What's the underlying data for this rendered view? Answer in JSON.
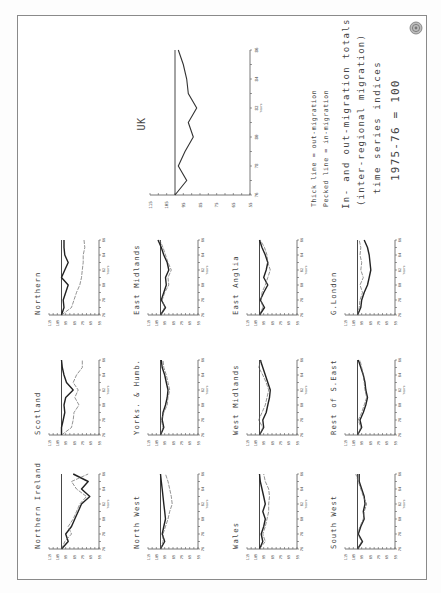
{
  "legend": {
    "line1": "Thick line = out-migration",
    "line2": "Pecked line = in-migration",
    "title1": "In- and out-migration totals",
    "title2": "(inter-regional migration)",
    "title3": "time series indices",
    "title4": "1975-76 = 100"
  },
  "emblem": "crest-emblem",
  "chart_data": [
    {
      "type": "line",
      "title": "UK",
      "xlabel": "Years",
      "x_ticks": [
        "76",
        "78",
        "80",
        "82",
        "84",
        "86"
      ],
      "y_ticks": [
        "115",
        "105",
        "95",
        "85",
        "75",
        "65",
        "55"
      ],
      "ylim": [
        55,
        115
      ],
      "xlim": [
        76,
        86
      ],
      "baseline": 100,
      "x": [
        76,
        77,
        78,
        79,
        80,
        81,
        82,
        83,
        84,
        85,
        86
      ],
      "series": [
        {
          "name": "out-migration",
          "values": [
            100,
            93,
            98,
            94,
            89,
            92,
            87,
            92,
            93,
            95,
            98
          ]
        }
      ]
    },
    {
      "type": "line",
      "title": "Northern",
      "xlabel": "Years",
      "x_ticks": [
        "76",
        "78",
        "80",
        "82",
        "84",
        "86"
      ],
      "y_ticks": [
        "115",
        "105",
        "95",
        "85",
        "75",
        "65",
        "55"
      ],
      "ylim": [
        55,
        115
      ],
      "xlim": [
        76,
        86
      ],
      "baseline": 100,
      "x": [
        76,
        77,
        78,
        79,
        80,
        81,
        82,
        83,
        84,
        85,
        86
      ],
      "series": [
        {
          "name": "out-migration",
          "values": [
            100,
            97,
            98,
            95,
            92,
            100,
            96,
            92,
            96,
            97,
            97
          ]
        },
        {
          "name": "in-migration",
          "values": [
            100,
            88,
            85,
            82,
            78,
            76,
            75,
            74,
            74,
            72,
            73
          ]
        }
      ]
    },
    {
      "type": "line",
      "title": "East Midlands",
      "xlabel": "Years",
      "x_ticks": [
        "76",
        "78",
        "80",
        "82",
        "84",
        "86"
      ],
      "y_ticks": [
        "115",
        "105",
        "95",
        "85",
        "75",
        "65",
        "55"
      ],
      "ylim": [
        55,
        115
      ],
      "xlim": [
        76,
        86
      ],
      "baseline": 100,
      "x": [
        76,
        77,
        78,
        79,
        80,
        81,
        82,
        83,
        84,
        85,
        86
      ],
      "series": [
        {
          "name": "out-migration",
          "values": [
            100,
            94,
            99,
            96,
            93,
            94,
            90,
            92,
            96,
            99,
            103
          ]
        },
        {
          "name": "in-migration",
          "values": [
            100,
            95,
            98,
            95,
            90,
            91,
            87,
            91,
            94,
            97,
            101
          ]
        }
      ]
    },
    {
      "type": "line",
      "title": "East Anglia",
      "xlabel": "Years",
      "x_ticks": [
        "76",
        "78",
        "80",
        "82",
        "84",
        "86"
      ],
      "y_ticks": [
        "115",
        "105",
        "95",
        "85",
        "75",
        "65",
        "55"
      ],
      "ylim": [
        55,
        115
      ],
      "xlim": [
        76,
        86
      ],
      "baseline": 100,
      "x": [
        76,
        77,
        78,
        79,
        80,
        81,
        82,
        83,
        84,
        85,
        86
      ],
      "series": [
        {
          "name": "out-migration",
          "values": [
            100,
            94,
            99,
            95,
            90,
            95,
            92,
            90,
            93,
            97,
            100
          ]
        },
        {
          "name": "in-migration",
          "values": [
            100,
            96,
            98,
            97,
            93,
            90,
            87,
            90,
            91,
            94,
            99
          ]
        }
      ]
    },
    {
      "type": "line",
      "title": "G.London",
      "xlabel": "Years",
      "x_ticks": [
        "76",
        "78",
        "80",
        "82",
        "84",
        "86"
      ],
      "y_ticks": [
        "115",
        "105",
        "95",
        "85",
        "75",
        "65",
        "55"
      ],
      "ylim": [
        55,
        115
      ],
      "xlim": [
        76,
        86
      ],
      "baseline": 100,
      "x": [
        76,
        77,
        78,
        79,
        80,
        81,
        82,
        83,
        84,
        85,
        86
      ],
      "series": [
        {
          "name": "out-migration",
          "values": [
            100,
            96,
            95,
            92,
            88,
            86,
            84,
            85,
            86,
            88,
            92
          ]
        },
        {
          "name": "in-migration",
          "values": [
            100,
            98,
            97,
            94,
            97,
            93,
            96,
            95,
            97,
            96,
            98
          ]
        }
      ]
    },
    {
      "type": "line",
      "title": "Scotland",
      "xlabel": "Years",
      "x_ticks": [
        "76",
        "78",
        "80",
        "82",
        "84",
        "86"
      ],
      "y_ticks": [
        "115",
        "105",
        "95",
        "85",
        "75",
        "65",
        "55"
      ],
      "ylim": [
        55,
        115
      ],
      "xlim": [
        76,
        86
      ],
      "baseline": 100,
      "x": [
        76,
        77,
        78,
        79,
        80,
        81,
        82,
        83,
        84,
        85,
        86
      ],
      "series": [
        {
          "name": "out-migration",
          "values": [
            100,
            100,
            98,
            96,
            97,
            95,
            86,
            94,
            97,
            99,
            100
          ]
        },
        {
          "name": "in-migration",
          "values": [
            100,
            88,
            86,
            85,
            79,
            84,
            80,
            86,
            82,
            75,
            75
          ]
        }
      ]
    },
    {
      "type": "line",
      "title": "Yorks. & Humb.",
      "xlabel": "Years",
      "x_ticks": [
        "76",
        "78",
        "80",
        "82",
        "84",
        "86"
      ],
      "y_ticks": [
        "115",
        "105",
        "95",
        "85",
        "75",
        "65",
        "55"
      ],
      "ylim": [
        55,
        115
      ],
      "xlim": [
        76,
        86
      ],
      "baseline": 100,
      "x": [
        76,
        77,
        78,
        79,
        80,
        81,
        82,
        83,
        84,
        85,
        86
      ],
      "series": [
        {
          "name": "out-migration",
          "values": [
            100,
            96,
            98,
            97,
            94,
            92,
            91,
            93,
            95,
            98,
            99
          ]
        },
        {
          "name": "in-migration",
          "values": [
            100,
            97,
            99,
            96,
            92,
            91,
            89,
            91,
            93,
            96,
            97
          ]
        }
      ]
    },
    {
      "type": "line",
      "title": "West Midlands",
      "xlabel": "Years",
      "x_ticks": [
        "76",
        "78",
        "80",
        "82",
        "84",
        "86"
      ],
      "y_ticks": [
        "115",
        "105",
        "95",
        "85",
        "75",
        "65",
        "55"
      ],
      "ylim": [
        55,
        115
      ],
      "xlim": [
        76,
        86
      ],
      "baseline": 100,
      "x": [
        76,
        77,
        78,
        79,
        80,
        81,
        82,
        83,
        84,
        85,
        86
      ],
      "series": [
        {
          "name": "out-migration",
          "values": [
            100,
            95,
            96,
            92,
            90,
            88,
            87,
            90,
            93,
            96,
            99
          ]
        },
        {
          "name": "in-migration",
          "values": [
            100,
            96,
            101,
            97,
            93,
            91,
            89,
            92,
            96,
            101,
            98
          ]
        }
      ]
    },
    {
      "type": "line",
      "title": "Rest of S.East",
      "xlabel": "Years",
      "x_ticks": [
        "76",
        "78",
        "80",
        "82",
        "84",
        "86"
      ],
      "y_ticks": [
        "115",
        "105",
        "95",
        "85",
        "75",
        "65",
        "55"
      ],
      "ylim": [
        55,
        115
      ],
      "xlim": [
        76,
        86
      ],
      "baseline": 100,
      "x": [
        76,
        77,
        78,
        79,
        80,
        81,
        82,
        83,
        84,
        85,
        86
      ],
      "series": [
        {
          "name": "out-migration",
          "values": [
            100,
            95,
            97,
            93,
            90,
            88,
            90,
            91,
            93,
            96,
            99
          ]
        },
        {
          "name": "in-migration",
          "values": [
            100,
            96,
            99,
            95,
            92,
            89,
            91,
            92,
            93,
            95,
            97
          ]
        }
      ]
    },
    {
      "type": "line",
      "title": "Northern Ireland",
      "xlabel": "Years",
      "x_ticks": [
        "76",
        "78",
        "80",
        "82",
        "84",
        "86"
      ],
      "y_ticks": [
        "115",
        "105",
        "95",
        "85",
        "75",
        "65",
        "55"
      ],
      "ylim": [
        55,
        115
      ],
      "xlim": [
        76,
        86
      ],
      "baseline": 100,
      "x": [
        76,
        77,
        78,
        79,
        80,
        81,
        82,
        83,
        84,
        85,
        86
      ],
      "series": [
        {
          "name": "out-migration",
          "values": [
            100,
            92,
            95,
            88,
            84,
            80,
            76,
            66,
            76,
            68,
            86
          ]
        },
        {
          "name": "in-migration",
          "values": [
            100,
            96,
            88,
            92,
            86,
            82,
            78,
            70,
            82,
            88,
            68
          ]
        }
      ]
    },
    {
      "type": "line",
      "title": "North West",
      "xlabel": "Years",
      "x_ticks": [
        "76",
        "78",
        "80",
        "82",
        "84",
        "86"
      ],
      "y_ticks": [
        "115",
        "105",
        "95",
        "85",
        "75",
        "65",
        "55"
      ],
      "ylim": [
        55,
        115
      ],
      "xlim": [
        76,
        86
      ],
      "baseline": 100,
      "x": [
        76,
        77,
        78,
        79,
        80,
        81,
        82,
        83,
        84,
        85,
        86
      ],
      "series": [
        {
          "name": "out-migration",
          "values": [
            100,
            95,
            98,
            96,
            94,
            95,
            96,
            97,
            98,
            99,
            100
          ]
        },
        {
          "name": "in-migration",
          "values": [
            100,
            97,
            97,
            94,
            91,
            89,
            86,
            87,
            89,
            91,
            94
          ]
        }
      ]
    },
    {
      "type": "line",
      "title": "Wales",
      "xlabel": "Years",
      "x_ticks": [
        "76",
        "78",
        "80",
        "82",
        "84",
        "86"
      ],
      "y_ticks": [
        "115",
        "105",
        "95",
        "85",
        "75",
        "65",
        "55"
      ],
      "ylim": [
        55,
        115
      ],
      "xlim": [
        76,
        86
      ],
      "baseline": 100,
      "x": [
        76,
        77,
        78,
        79,
        80,
        81,
        82,
        83,
        84,
        85,
        86
      ],
      "series": [
        {
          "name": "out-migration",
          "values": [
            100,
            96,
            98,
            95,
            93,
            96,
            93,
            95,
            97,
            99,
            100
          ]
        },
        {
          "name": "in-migration",
          "values": [
            100,
            93,
            96,
            93,
            91,
            89,
            89,
            88,
            89,
            93,
            95
          ]
        }
      ]
    },
    {
      "type": "line",
      "title": "South West",
      "xlabel": "Years",
      "x_ticks": [
        "76",
        "78",
        "80",
        "82",
        "84",
        "86"
      ],
      "y_ticks": [
        "115",
        "105",
        "95",
        "85",
        "75",
        "65",
        "55"
      ],
      "ylim": [
        55,
        115
      ],
      "xlim": [
        76,
        86
      ],
      "baseline": 100,
      "x": [
        76,
        77,
        78,
        79,
        80,
        81,
        82,
        83,
        84,
        85,
        86
      ],
      "series": [
        {
          "name": "out-migration",
          "values": [
            100,
            94,
            99,
            96,
            92,
            93,
            91,
            92,
            95,
            98,
            98
          ]
        },
        {
          "name": "in-migration",
          "values": [
            100,
            95,
            100,
            97,
            93,
            92,
            89,
            93,
            96,
            99,
            102
          ]
        }
      ]
    }
  ]
}
